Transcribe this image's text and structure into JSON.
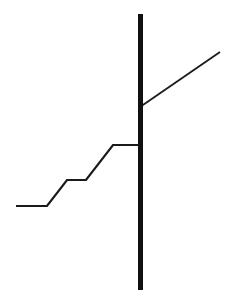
{
  "figure": {
    "title": "",
    "background_color": "#ffffff",
    "width": 231,
    "height": 304
  },
  "chart_data": {
    "type": "line",
    "title": "",
    "subtitle": "",
    "xlabel": "",
    "ylabel": "",
    "xlim": [
      0,
      231
    ],
    "ylim": [
      304,
      0
    ],
    "grid": false,
    "legend": null,
    "axes_visible": false,
    "tick_labels": {
      "x": [],
      "y": []
    },
    "annotations": [],
    "series": [
      {
        "name": "step-line-left",
        "shape": "polyline",
        "color": "#1a1a1a",
        "line_width": 2.2,
        "points": [
          [
            16,
            206
          ],
          [
            47,
            206
          ],
          [
            67,
            180
          ],
          [
            86,
            180
          ],
          [
            113,
            145
          ],
          [
            141,
            145
          ]
        ]
      },
      {
        "name": "diagonal-line-right",
        "shape": "polyline",
        "color": "#1a1a1a",
        "line_width": 1.8,
        "points": [
          [
            140,
            107
          ],
          [
            220,
            52
          ]
        ]
      },
      {
        "name": "vertical-bar",
        "shape": "line",
        "color": "#111111",
        "line_width": 5,
        "points": [
          [
            140.5,
            14
          ],
          [
            140.5,
            290
          ]
        ]
      }
    ]
  }
}
